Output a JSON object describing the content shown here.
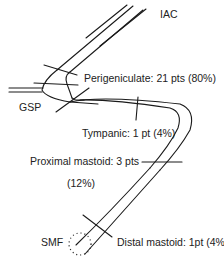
{
  "diagram": {
    "labels": {
      "iac": "IAC",
      "gsp": "GSP",
      "smf": "SMF",
      "perigeniculate": "Perigeniculate: 21 pts (80%)",
      "tympanic": "Tympanic: 1 pt (4%)",
      "proximal_mastoid_line1": "Proximal mastoid: 3 pts",
      "proximal_mastoid_line2": "(12%)",
      "distal_mastoid": "Distal mastoid: 1pt (4%)"
    },
    "segments": [
      {
        "name": "Perigeniculate",
        "patients": 21,
        "percent": 80
      },
      {
        "name": "Tympanic",
        "patients": 1,
        "percent": 4
      },
      {
        "name": "Proximal mastoid",
        "patients": 3,
        "percent": 12
      },
      {
        "name": "Distal mastoid",
        "patients": 1,
        "percent": 4
      }
    ],
    "line_color": "#1a1a1a"
  }
}
